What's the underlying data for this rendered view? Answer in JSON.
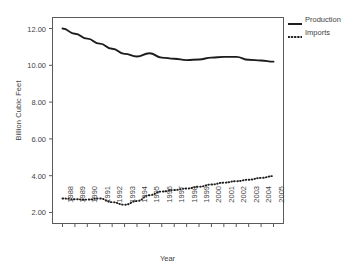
{
  "chart_data": {
    "type": "line",
    "title": "",
    "xlabel": "Year",
    "ylabel": "Billion Cubic Feet",
    "grid": false,
    "legend_position": "top-right-outside",
    "xlim": [
      1988,
      2005
    ],
    "ylim": [
      1.4,
      12.6
    ],
    "yticks": [
      2.0,
      4.0,
      6.0,
      8.0,
      10.0,
      12.0
    ],
    "ytick_labels": [
      "2.00",
      "4.00",
      "6.00",
      "8.00",
      "10.00",
      "12.00"
    ],
    "categories": [
      "1988",
      "1989",
      "1990",
      "1991",
      "1992",
      "1993",
      "1994",
      "1995",
      "1996",
      "1997",
      "1998",
      "1999",
      "2000",
      "2001",
      "2002",
      "2003",
      "2004",
      "2005"
    ],
    "series": [
      {
        "name": "Production",
        "style": "solid",
        "color": "#1c1c1c",
        "values": [
          12.0,
          11.72,
          11.45,
          11.18,
          10.9,
          10.62,
          10.48,
          10.66,
          10.42,
          10.36,
          10.28,
          10.32,
          10.42,
          10.46,
          10.46,
          10.3,
          10.26,
          10.2
        ]
      },
      {
        "name": "Imports",
        "style": "dotted",
        "color": "#1c1c1c",
        "values": [
          2.76,
          2.72,
          2.7,
          2.76,
          2.56,
          2.42,
          2.62,
          2.94,
          3.14,
          3.22,
          3.3,
          3.4,
          3.52,
          3.62,
          3.7,
          3.78,
          3.88,
          3.98
        ]
      }
    ]
  },
  "legend": {
    "items": [
      {
        "label": "Production",
        "icon": "solid-line-swatch"
      },
      {
        "label": "Imports",
        "icon": "dotted-line-swatch"
      }
    ]
  },
  "axes": {
    "x_title": "Year",
    "y_title": "Billion Cubic Feet"
  }
}
